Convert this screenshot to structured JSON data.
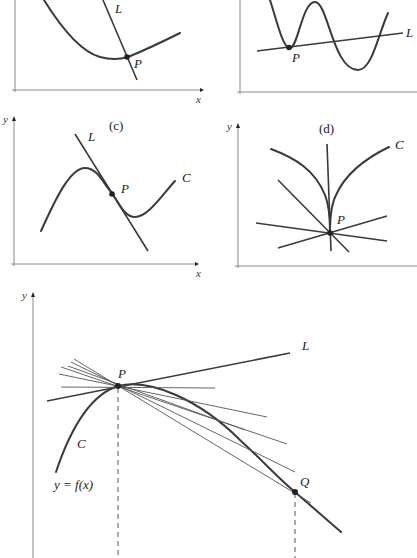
{
  "panels": {
    "a": {
      "curve_label": "",
      "line_label": "L",
      "point_label": "P",
      "x_axis_label": "x"
    },
    "b": {
      "line_label": "L",
      "point_label": "P"
    },
    "c": {
      "panel_label": "(c)",
      "curve_label": "C",
      "line_label": "L",
      "point_label": "P",
      "x_axis_label": "x",
      "y_axis_label": "y"
    },
    "d": {
      "panel_label": "(d)",
      "curve_label": "C",
      "point_label": "P",
      "y_axis_label": "y"
    },
    "main": {
      "y_axis_label": "y",
      "line_label": "L",
      "point_p_label": "P",
      "point_q_label": "Q",
      "curve_label": "C",
      "function_label": "y = f(x)"
    }
  },
  "colors": {
    "curve": "#3a3a3a",
    "axis": "#8a8a8a",
    "background": "#ffffff"
  }
}
